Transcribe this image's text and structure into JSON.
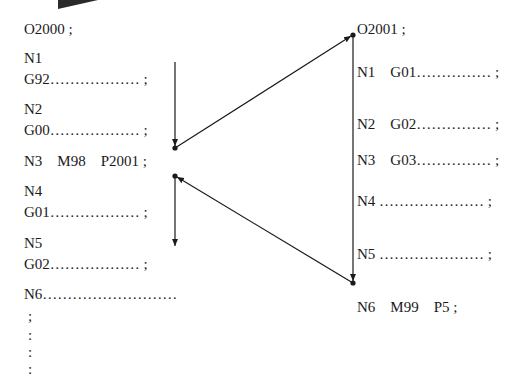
{
  "main_program": {
    "title": "O2000 ;",
    "lines": [
      {
        "label": "N1",
        "code": "G92……………… ;"
      },
      {
        "label": "N2",
        "code": "G00……………… ;"
      },
      {
        "label": "N3    M98    P2001 ;",
        "code": ""
      },
      {
        "label": "N4",
        "code": "G01……………… ;"
      },
      {
        "label": "N5",
        "code": "G02……………… ;"
      },
      {
        "label": "N6………………………",
        "code": ""
      }
    ],
    "continuation": [
      ";",
      ":",
      ":",
      ":"
    ]
  },
  "subprogram": {
    "title": "O2001 ;",
    "lines": [
      "N1    G01…………… ;",
      "N2    G02…………… ;",
      "N3    G03…………… ;",
      "N4 ………………… ;",
      "N5 ………………… ;",
      "N6    M99    P5 ;"
    ]
  },
  "colors": {
    "line": "#1a1a1a",
    "text": "#1a1a1a",
    "background": "#ffffff"
  }
}
